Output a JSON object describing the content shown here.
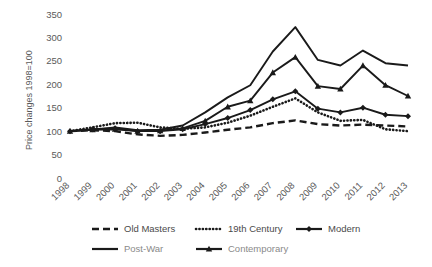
{
  "chart_data": {
    "type": "line",
    "title": "",
    "xlabel": "",
    "ylabel": "Price changes  1998=100",
    "ylim": [
      0,
      350
    ],
    "yticks": [
      0,
      50,
      100,
      150,
      200,
      250,
      300,
      350
    ],
    "grid": false,
    "legend_position": "bottom",
    "categories": [
      "1998",
      "1999",
      "2000",
      "2001",
      "2002",
      "2003",
      "2004",
      "2005",
      "2006",
      "2007",
      "2008",
      "2009",
      "2010",
      "2011",
      "2012",
      "2013"
    ],
    "series": [
      {
        "name": "Old Masters",
        "style": "dashed",
        "marker": "none",
        "color": "#1a1a1a",
        "values": [
          100,
          102,
          100,
          93,
          90,
          92,
          97,
          103,
          108,
          117,
          123,
          115,
          112,
          114,
          112,
          110
        ]
      },
      {
        "name": "19th Century",
        "style": "dotted",
        "marker": "none",
        "color": "#1a1a1a",
        "values": [
          100,
          108,
          117,
          118,
          108,
          105,
          108,
          118,
          133,
          152,
          170,
          140,
          122,
          124,
          104,
          100
        ]
      },
      {
        "name": "Modern",
        "style": "solid",
        "marker": "diamond",
        "color": "#1a1a1a",
        "values": [
          100,
          104,
          106,
          100,
          100,
          104,
          115,
          128,
          145,
          168,
          185,
          148,
          140,
          150,
          135,
          132
        ]
      },
      {
        "name": "Post-War",
        "style": "solid",
        "marker": "none",
        "color": "#1a1a1a",
        "values": [
          100,
          103,
          108,
          102,
          103,
          112,
          140,
          172,
          198,
          270,
          322,
          252,
          240,
          272,
          245,
          240
        ]
      },
      {
        "name": "Contemporary",
        "style": "solid",
        "marker": "triangle",
        "color": "#1a1a1a",
        "values": [
          100,
          103,
          104,
          100,
          101,
          106,
          122,
          152,
          165,
          225,
          258,
          196,
          190,
          240,
          198,
          175
        ]
      }
    ]
  },
  "axis": {
    "y_title": "Price changes  1998=100",
    "y_tick_labels": [
      "350",
      "300",
      "250",
      "200",
      "150",
      "100",
      "50",
      "0"
    ],
    "x_tick_labels": [
      "1998",
      "1999",
      "2000",
      "2001",
      "2002",
      "2003",
      "2004",
      "2005",
      "2006",
      "2007",
      "2008",
      "2009",
      "2010",
      "2011",
      "2012",
      "2013"
    ]
  },
  "legend": {
    "row1": [
      {
        "label": "Old Masters",
        "style": "dashed",
        "marker": "none"
      },
      {
        "label": "19th Century",
        "style": "dotted",
        "marker": "none"
      },
      {
        "label": "Modern",
        "style": "solid",
        "marker": "diamond"
      }
    ],
    "row2": [
      {
        "label": "Post-War",
        "style": "solid",
        "marker": "none"
      },
      {
        "label": "Contemporary",
        "style": "solid",
        "marker": "triangle"
      }
    ]
  },
  "colors": {
    "ink": "#1a1a1a",
    "text": "#5a5a5a",
    "background": "#ffffff"
  }
}
